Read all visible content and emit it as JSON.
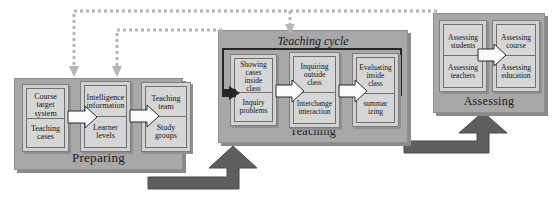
{
  "diagram": {
    "colors": {
      "panel_fill": "#a8a8a8",
      "group_fill": "#d2d2d2",
      "cell_fill": "#d6d6d6",
      "chevron_fill": "#fbfbfb",
      "loop_stroke": "#262626",
      "thick_arrow": "#5e5e5e",
      "dotted_arrow": "#b6b6b6",
      "text": "#141414",
      "background": "#ffffff"
    }
  },
  "phases": {
    "preparing": {
      "label": "Preparing",
      "groups": [
        {
          "top": "Course\ntarget\nsystem",
          "bottom": "Teaching\ncases"
        },
        {
          "top": "Intelligence\ninformation",
          "bottom": "Learner\nlevels"
        },
        {
          "top": "Teaching\nteam",
          "bottom": "Study\ngroups"
        }
      ]
    },
    "teaching": {
      "label": "Teaching",
      "cycle_label": "Teaching cycle",
      "groups": [
        {
          "top": "Showing\ncases\ninside\nclass",
          "bottom": "Inquiry\nproblems"
        },
        {
          "top": "Inquiring\noutside\nclass",
          "bottom": "Interchange\ninteraction"
        },
        {
          "top": "Evaluating\ninside\nclass",
          "bottom": "summar\nizing"
        }
      ]
    },
    "assessing": {
      "label": "Assessing",
      "groups": [
        {
          "top": "Assessing\nstudents",
          "bottom": "Assessing\nteachers"
        },
        {
          "top": "Assessing\ncourse",
          "bottom": "Assessing\neducation"
        }
      ]
    }
  },
  "connectors": {
    "flow_arrows": [
      {
        "name": "preparing-to-teaching",
        "style": "thick-elbow-up"
      },
      {
        "name": "teaching-to-assessing",
        "style": "thick-elbow-up"
      }
    ],
    "feedback_arrows": [
      {
        "name": "assessing-to-preparing",
        "style": "dotted-elbow-down"
      },
      {
        "name": "teaching-to-preparing",
        "style": "dotted-elbow-down"
      }
    ],
    "inline_chevrons": [
      {
        "name": "preparing-chevron-1"
      },
      {
        "name": "preparing-chevron-2"
      },
      {
        "name": "teaching-chevron-1"
      },
      {
        "name": "teaching-chevron-2"
      },
      {
        "name": "assessing-chevron-1"
      }
    ]
  }
}
